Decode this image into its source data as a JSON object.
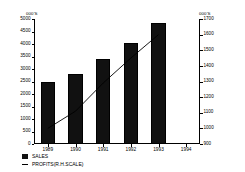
{
  "chart_data": {
    "type": "bar",
    "title": "",
    "subtitle": "",
    "xlabel": "",
    "ylabel": "000'S",
    "y2label": "000'S",
    "categories": [
      "1989",
      "1990",
      "1991",
      "1992",
      "1993",
      "1994"
    ],
    "grid": false,
    "legend_position": "bottom-left",
    "ylim": [
      0,
      5000
    ],
    "ytick_step": 500,
    "yticks": [
      0,
      500,
      1000,
      1500,
      2000,
      2500,
      3000,
      3500,
      4000,
      4500,
      5000
    ],
    "y2lim": [
      900,
      1700
    ],
    "y2tick_step": 100,
    "y2ticks": [
      900,
      1000,
      1100,
      1200,
      1300,
      1400,
      1500,
      1600,
      1700
    ],
    "series": [
      {
        "name": "SALES",
        "type": "bar",
        "axis": "left",
        "color": "#111111",
        "categories": [
          "1989",
          "1990",
          "1991",
          "1992",
          "1993",
          "1994"
        ],
        "values": [
          2500,
          2800,
          3400,
          4050,
          4850,
          null
        ]
      },
      {
        "name": "PROFITS(R.H.SCALE)",
        "type": "line",
        "axis": "right",
        "color": "#000000",
        "categories": [
          "1989",
          "1990",
          "1991",
          "1992",
          "1993",
          "1994"
        ],
        "values": [
          1000,
          1110,
          1290,
          1450,
          1600,
          null
        ]
      }
    ]
  },
  "legend": {
    "items": [
      {
        "label": "SALES",
        "marker": "filled-square"
      },
      {
        "label": "PROFITS(R.H.SCALE)",
        "marker": "line"
      }
    ]
  }
}
